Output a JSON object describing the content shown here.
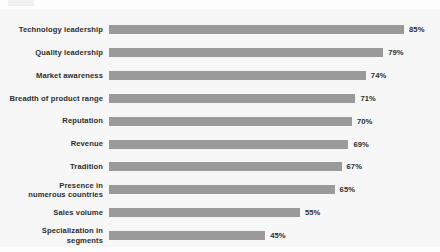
{
  "chart_data": {
    "type": "bar",
    "orientation": "horizontal",
    "title": "",
    "xlabel": "",
    "ylabel": "",
    "xlim": [
      0,
      100
    ],
    "grid": false,
    "legend": false,
    "value_suffix": "%",
    "categories": [
      "Technology leadership",
      "Quality leadership",
      "Market awareness",
      "Breadth of product range",
      "Reputation",
      "Revenue",
      "Tradition",
      "Presence in\nnumerous countries",
      "Sales volume",
      "Specialization in\nsegments"
    ],
    "values": [
      85,
      79,
      74,
      71,
      70,
      69,
      67,
      65,
      55,
      45
    ],
    "value_labels": [
      "85%",
      "79%",
      "74%",
      "71%",
      "70%",
      "69%",
      "67%",
      "65%",
      "55%",
      "45%"
    ],
    "bar_color": "#9a9a9a",
    "label_color": "#2e2e2e",
    "plot_background": "#f7f7f7",
    "page_background": "#fdfdfd"
  }
}
